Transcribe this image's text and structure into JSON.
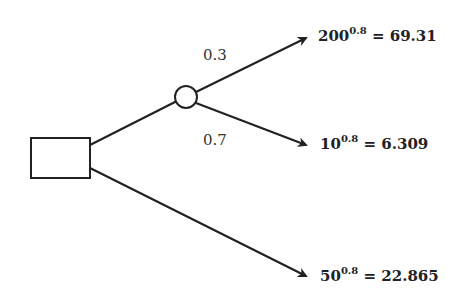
{
  "diagram": {
    "type": "decision-tree",
    "decision_node": {
      "shape": "square"
    },
    "chance_node": {
      "shape": "circle"
    },
    "branches": [
      {
        "from": "chance",
        "probability": "0.3",
        "outcome": {
          "base": "200",
          "exponent": "0.8",
          "equals": "= 69.31"
        }
      },
      {
        "from": "chance",
        "probability": "0.7",
        "outcome": {
          "base": "10",
          "exponent": "0.8",
          "equals": "= 6.309"
        }
      },
      {
        "from": "decision",
        "probability": "",
        "outcome": {
          "base": "50",
          "exponent": "0.8",
          "equals": "= 22.865"
        }
      }
    ],
    "colors": {
      "line": "#222222",
      "background": "#ffffff"
    }
  }
}
